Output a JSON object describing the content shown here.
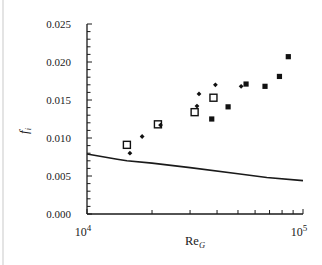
{
  "chart_data": {
    "type": "scatter",
    "title": "",
    "xlabel": "Re_G",
    "xlabel_main": "Re",
    "xlabel_sub": "G",
    "ylabel": "f_i",
    "ylabel_main": "f",
    "ylabel_sub": "i",
    "xscale": "log",
    "xlim": [
      10000,
      100000
    ],
    "ylim": [
      0.0,
      0.025
    ],
    "grid": false,
    "legend": null,
    "y_ticks": [
      "0.000",
      "0.005",
      "0.010",
      "0.015",
      "0.020",
      "0.025"
    ],
    "y_tick_values": [
      0.0,
      0.005,
      0.01,
      0.015,
      0.02,
      0.025
    ],
    "x_tick_labels": [
      {
        "base": "10",
        "exp": "4",
        "value": 10000
      },
      {
        "base": "10",
        "exp": "5",
        "value": 100000
      }
    ],
    "series": [
      {
        "name": "open squares",
        "marker": "open-square",
        "points": [
          {
            "x": 15300,
            "y": 0.0091
          },
          {
            "x": 21300,
            "y": 0.0118
          },
          {
            "x": 31500,
            "y": 0.0134
          },
          {
            "x": 38500,
            "y": 0.0153
          }
        ]
      },
      {
        "name": "diamonds",
        "marker": "diamond",
        "points": [
          {
            "x": 15800,
            "y": 0.008
          },
          {
            "x": 18000,
            "y": 0.0102
          },
          {
            "x": 21900,
            "y": 0.0117
          },
          {
            "x": 32300,
            "y": 0.0142
          },
          {
            "x": 33000,
            "y": 0.0158
          },
          {
            "x": 39300,
            "y": 0.017
          },
          {
            "x": 51700,
            "y": 0.0168
          }
        ]
      },
      {
        "name": "filled squares",
        "marker": "filled-square",
        "points": [
          {
            "x": 37800,
            "y": 0.0125
          },
          {
            "x": 45000,
            "y": 0.0141
          },
          {
            "x": 54500,
            "y": 0.0171
          },
          {
            "x": 66700,
            "y": 0.0168
          },
          {
            "x": 77800,
            "y": 0.0181
          },
          {
            "x": 85500,
            "y": 0.0207
          }
        ]
      },
      {
        "name": "correlation curve",
        "type": "line",
        "points": [
          {
            "x": 10000,
            "y": 0.0079
          },
          {
            "x": 13800,
            "y": 0.0072
          },
          {
            "x": 15300,
            "y": 0.007
          },
          {
            "x": 20000,
            "y": 0.0067
          },
          {
            "x": 30000,
            "y": 0.0061
          },
          {
            "x": 50000,
            "y": 0.0053
          },
          {
            "x": 68000,
            "y": 0.0048
          },
          {
            "x": 100000,
            "y": 0.0044
          }
        ]
      }
    ]
  },
  "style": {
    "axis_color": "#1a1a1a",
    "marker_color": "#111111",
    "background": "#ffffff"
  }
}
